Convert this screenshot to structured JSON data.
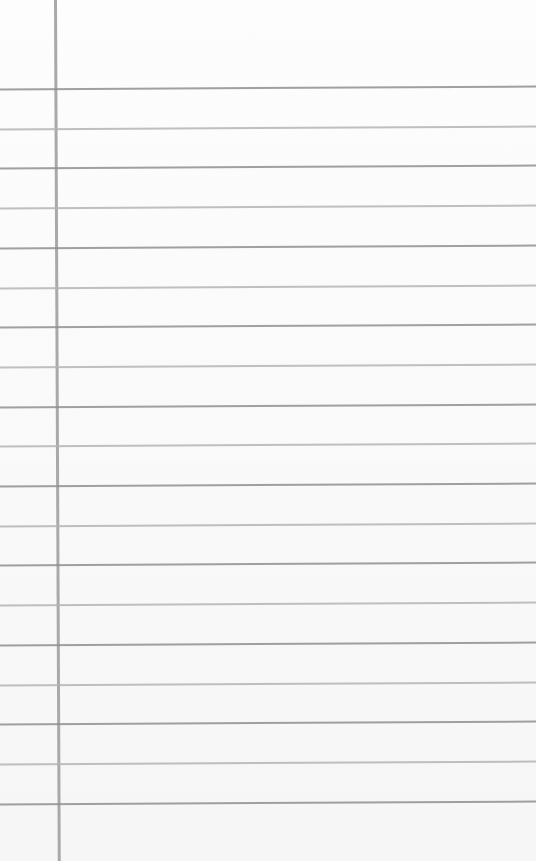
{
  "paper": {
    "type": "lined-notebook-paper",
    "background": "#fdfdfd",
    "rule_color": "#8f8f8f",
    "margin_color": "#a9a9a9",
    "margin_x": 54,
    "rule_count": 19,
    "first_rule_y": 87,
    "rule_spacing": 39.7
  }
}
